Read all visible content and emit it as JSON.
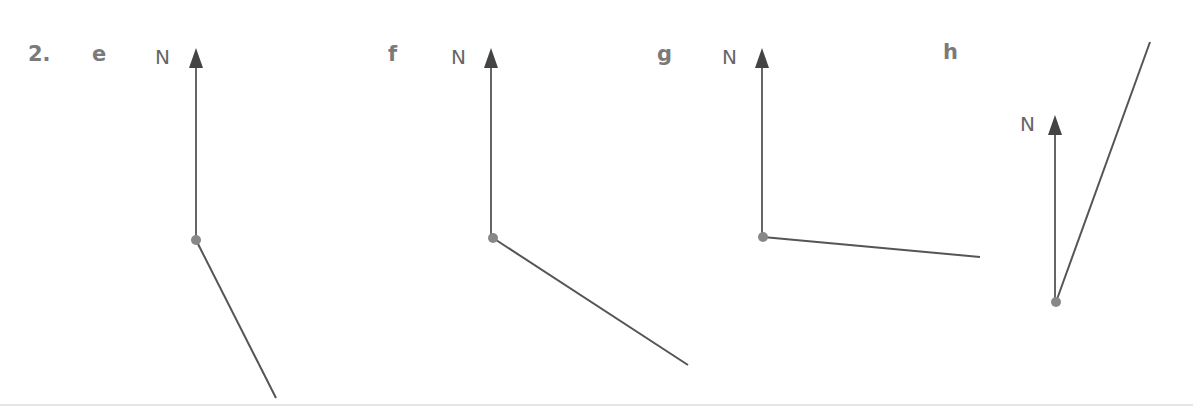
{
  "question": {
    "number": "2."
  },
  "diagrams": [
    {
      "letter": "e",
      "north_label": "N",
      "point": [
        196,
        240
      ],
      "north_tip": [
        196,
        50
      ],
      "bearing_end": [
        276,
        398
      ]
    },
    {
      "letter": "f",
      "north_label": "N",
      "point": [
        493,
        238
      ],
      "north_tip": [
        490,
        50
      ],
      "bearing_end": [
        688,
        365
      ]
    },
    {
      "letter": "g",
      "north_label": "N",
      "point": [
        763,
        237
      ],
      "north_tip": [
        762,
        50
      ],
      "bearing_end": [
        980,
        257
      ]
    },
    {
      "letter": "h",
      "north_label": "N",
      "point": [
        1056,
        302
      ],
      "north_tip": [
        1056,
        116
      ],
      "bearing_end": [
        1150,
        42
      ]
    }
  ],
  "colors": {
    "label": "#7a7a7a",
    "line": "#555555",
    "point": "#888888"
  }
}
